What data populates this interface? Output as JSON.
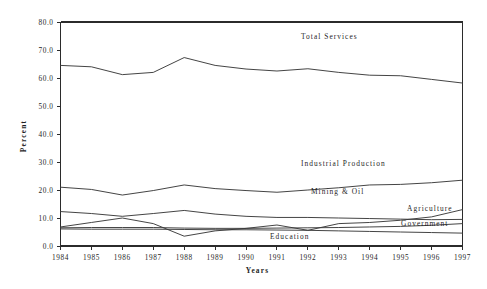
{
  "chart_data": {
    "type": "line",
    "title": "",
    "xlabel": "Years",
    "ylabel": "Percent",
    "grid": false,
    "legend_position": "inline-annotations",
    "x": [
      1984,
      1985,
      1986,
      1987,
      1988,
      1989,
      1990,
      1991,
      1992,
      1993,
      1994,
      1995,
      1996,
      1997
    ],
    "categories": [
      "1984",
      "1985",
      "1986",
      "1987",
      "1988",
      "1989",
      "1990",
      "1991",
      "1992",
      "1993",
      "1994",
      "1995",
      "1996",
      "1997"
    ],
    "ylim": [
      0.0,
      80.0
    ],
    "xlim": [
      1984,
      1997
    ],
    "ytick_labels": [
      "0.0",
      "10.0",
      "20.0",
      "30.0",
      "40.0",
      "50.0",
      "60.0",
      "70.0",
      "80.0"
    ],
    "ytick_values": [
      0.0,
      10.0,
      20.0,
      30.0,
      40.0,
      50.0,
      60.0,
      70.0,
      80.0
    ],
    "series": [
      {
        "name": "Total Services",
        "label": "Total Services",
        "values": [
          64.5,
          64.0,
          61.2,
          62.0,
          67.3,
          64.5,
          63.2,
          62.5,
          63.3,
          62.0,
          61.0,
          60.8,
          59.5,
          58.2
        ]
      },
      {
        "name": "Industrial Production",
        "label": "Industrial Production",
        "values": [
          21.0,
          20.2,
          18.2,
          19.8,
          21.8,
          20.5,
          19.8,
          19.2,
          20.0,
          20.8,
          21.8,
          22.0,
          22.6,
          23.5
        ]
      },
      {
        "name": "Mining & Oil",
        "label": "Mining & Oil",
        "values": [
          12.3,
          11.6,
          10.6,
          11.6,
          12.7,
          11.4,
          10.6,
          10.2,
          10.2,
          10.0,
          9.8,
          9.6,
          9.4,
          9.5
        ]
      },
      {
        "name": "Agriculture",
        "label": "Agriculture",
        "values": [
          6.8,
          8.4,
          10.0,
          8.0,
          3.5,
          5.4,
          6.3,
          7.5,
          5.6,
          8.0,
          8.4,
          9.2,
          10.4,
          13.0
        ]
      },
      {
        "name": "Government",
        "label": "Government",
        "values": [
          6.5,
          6.6,
          6.6,
          6.6,
          6.4,
          6.3,
          6.3,
          6.4,
          6.5,
          6.6,
          6.8,
          7.0,
          7.4,
          8.0
        ]
      },
      {
        "name": "Education",
        "label": "Education",
        "values": [
          6.1,
          6.0,
          6.0,
          6.0,
          5.9,
          5.8,
          5.8,
          5.7,
          5.6,
          5.4,
          5.2,
          5.0,
          4.8,
          4.6
        ]
      }
    ],
    "annotations": [
      {
        "text": "Total Services",
        "x_px": 301,
        "y_px": 39
      },
      {
        "text": "Industrial Production",
        "x_px": 301,
        "y_px": 166
      },
      {
        "text": "Mining & Oil",
        "x_px": 311,
        "y_px": 194
      },
      {
        "text": "Agriculture",
        "x_px": 407,
        "y_px": 211
      },
      {
        "text": "Government",
        "x_px": 401,
        "y_px": 226
      },
      {
        "text": "Education",
        "x_px": 270,
        "y_px": 239
      }
    ]
  }
}
